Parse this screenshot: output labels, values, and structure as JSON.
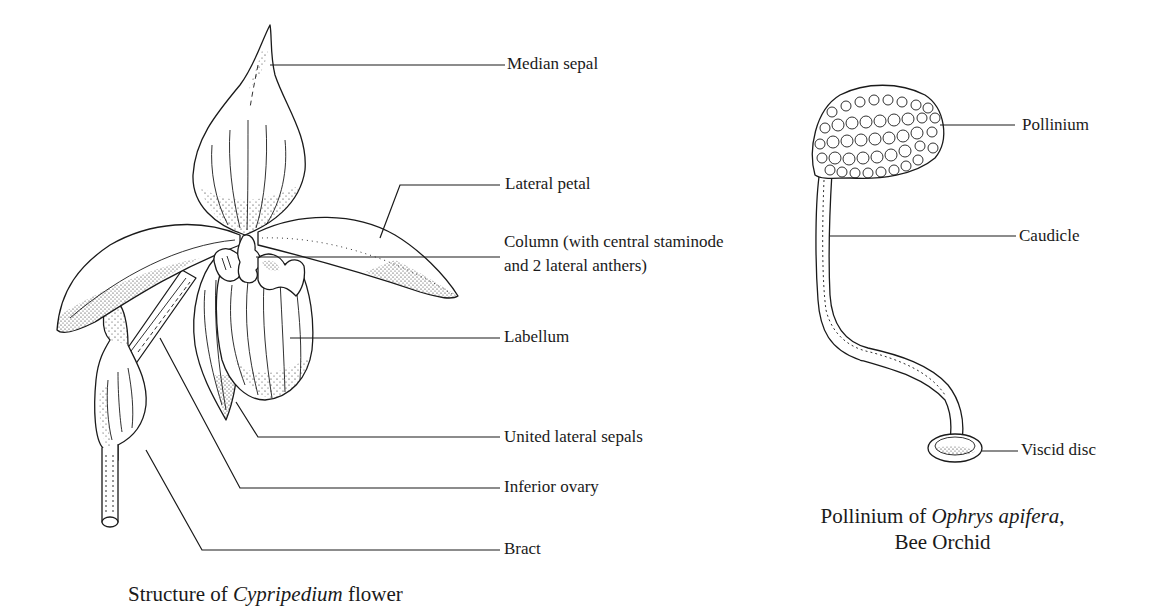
{
  "figure_left": {
    "caption_prefix": "Structure of ",
    "caption_italic": "Cypripedium",
    "caption_suffix": " flower",
    "labels": [
      {
        "id": "median-sepal",
        "text": "Median sepal"
      },
      {
        "id": "lateral-petal",
        "text": "Lateral petal"
      },
      {
        "id": "column-line1",
        "text": "Column (with central staminode"
      },
      {
        "id": "column-line2",
        "text": "and 2 lateral anthers)"
      },
      {
        "id": "labellum",
        "text": "Labellum"
      },
      {
        "id": "united-lateral-sepals",
        "text": "United lateral sepals"
      },
      {
        "id": "inferior-ovary",
        "text": "Inferior ovary"
      },
      {
        "id": "bract",
        "text": "Bract"
      }
    ]
  },
  "figure_right": {
    "caption_line1_prefix": "Pollinium of ",
    "caption_line1_italic": "Ophrys apifera",
    "caption_line1_suffix": ",",
    "caption_line2": "Bee Orchid",
    "labels": [
      {
        "id": "pollinium",
        "text": "Pollinium"
      },
      {
        "id": "caudicle",
        "text": "Caudicle"
      },
      {
        "id": "viscid-disc",
        "text": "Viscid disc"
      }
    ]
  },
  "colors": {
    "ink": "#1a1a1a",
    "background": "#ffffff"
  }
}
